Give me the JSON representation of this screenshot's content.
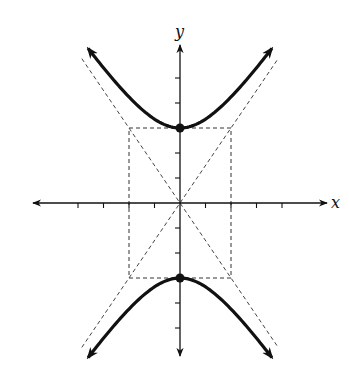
{
  "chart_data": {
    "type": "line",
    "title": "",
    "equation": "y^2/9 - x^2/4 = 1",
    "xlabel": "x",
    "ylabel": "y",
    "xlim": [
      -6,
      6
    ],
    "ylim": [
      -6,
      6
    ],
    "grid": false,
    "x_ticks": [
      -4,
      -3,
      -2,
      -1,
      1,
      2,
      3,
      4
    ],
    "y_ticks": [
      -5,
      -4,
      -3,
      -2,
      -1,
      1,
      2,
      3,
      4,
      5
    ],
    "a": 3,
    "b": 2,
    "vertices": [
      {
        "x": 0,
        "y": 3
      },
      {
        "x": 0,
        "y": -3
      }
    ],
    "asymptotes": [
      {
        "slope": 1.5
      },
      {
        "slope": -1.5
      }
    ],
    "fundamental_rectangle": {
      "x": [
        -2,
        2
      ],
      "y": [
        -3,
        3
      ]
    },
    "branch_x_range": [
      -3.6,
      3.6
    ],
    "series": [
      {
        "name": "upper branch",
        "style": "solid-thick"
      },
      {
        "name": "lower branch",
        "style": "solid-thick"
      },
      {
        "name": "asymptotes",
        "style": "dashed"
      },
      {
        "name": "central rectangle",
        "style": "dashed"
      }
    ]
  }
}
